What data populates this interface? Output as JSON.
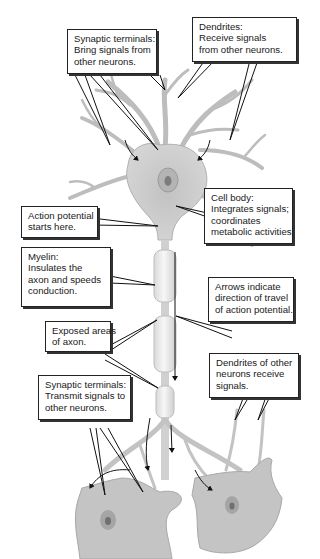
{
  "diagram": {
    "callouts": [
      {
        "id": "synaptic-terminals-top",
        "lines": [
          "Synaptic terminals:",
          "Bring signals from",
          "other neurons."
        ]
      },
      {
        "id": "dendrites",
        "lines": [
          "Dendrites:",
          "Receive signals",
          "from other neurons."
        ]
      },
      {
        "id": "cell-body",
        "lines": [
          "Cell body:",
          "Integrates signals;",
          "coordinates",
          "metabolic activities."
        ]
      },
      {
        "id": "action-potential",
        "lines": [
          "Action potential",
          "starts here."
        ]
      },
      {
        "id": "myelin",
        "lines": [
          "Myelin:",
          "Insulates the",
          "axon and speeds",
          "conduction."
        ]
      },
      {
        "id": "arrows",
        "lines": [
          "Arrows indicate",
          "direction of travel",
          "of action potential."
        ]
      },
      {
        "id": "exposed-axon",
        "lines": [
          "Exposed areas",
          "of axon."
        ]
      },
      {
        "id": "dendrites-other",
        "lines": [
          "Dendrites of other",
          "neurons receive",
          "signals."
        ]
      },
      {
        "id": "synaptic-terminals-bottom",
        "lines": [
          "Synaptic terminals:",
          "Transmit signals to",
          "other neurons."
        ]
      }
    ],
    "colors": {
      "cell": "#c9c9c9",
      "cell_dark": "#a8a8a8",
      "myelin": "#eeeeee",
      "line": "#1a1a1a",
      "box_border": "#222222"
    }
  }
}
